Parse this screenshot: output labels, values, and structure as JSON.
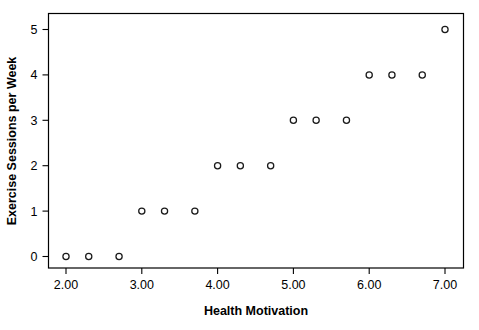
{
  "chart_data": {
    "type": "scatter",
    "title": "",
    "xlabel": "Health Motivation",
    "ylabel": "Exercise Sessions per Week",
    "xlim": [
      1.8,
      7.3
    ],
    "ylim": [
      -0.35,
      5.3
    ],
    "grid": false,
    "legend": null,
    "xticks": [
      2.0,
      3.0,
      4.0,
      5.0,
      6.0,
      7.0
    ],
    "xticklabels": [
      "2.00",
      "3.00",
      "4.00",
      "5.00",
      "6.00",
      "7.00"
    ],
    "yticks": [
      0,
      1,
      2,
      3,
      4,
      5
    ],
    "yticklabels": [
      "0",
      "1",
      "2",
      "3",
      "4",
      "5"
    ],
    "marker": "open-circle",
    "marker_color": "#1a1a1a",
    "x": [
      2.0,
      2.3,
      2.7,
      3.0,
      3.3,
      3.7,
      4.0,
      4.3,
      4.7,
      5.0,
      5.3,
      5.7,
      6.0,
      6.3,
      6.7,
      7.0
    ],
    "y": [
      0,
      0,
      0,
      1,
      1,
      1,
      2,
      2,
      2,
      3,
      3,
      3,
      4,
      4,
      4,
      5
    ],
    "points": [
      {
        "x": 2.0,
        "y": 0
      },
      {
        "x": 2.3,
        "y": 0
      },
      {
        "x": 2.7,
        "y": 0
      },
      {
        "x": 3.0,
        "y": 1
      },
      {
        "x": 3.3,
        "y": 1
      },
      {
        "x": 3.7,
        "y": 1
      },
      {
        "x": 4.0,
        "y": 2
      },
      {
        "x": 4.3,
        "y": 2
      },
      {
        "x": 4.7,
        "y": 2
      },
      {
        "x": 5.0,
        "y": 3
      },
      {
        "x": 5.3,
        "y": 3
      },
      {
        "x": 5.7,
        "y": 3
      },
      {
        "x": 6.0,
        "y": 4
      },
      {
        "x": 6.3,
        "y": 4
      },
      {
        "x": 6.7,
        "y": 4
      },
      {
        "x": 7.0,
        "y": 5
      }
    ]
  },
  "colors": {
    "background": "#ffffff",
    "axis": "#000000",
    "marker_stroke": "#1a1a1a"
  }
}
